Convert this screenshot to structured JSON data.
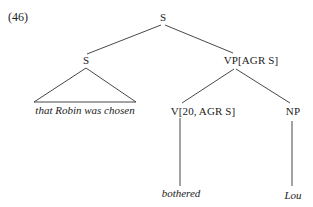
{
  "example": {
    "number": "(46)"
  },
  "tree": {
    "root": {
      "label": "S"
    },
    "left_s": {
      "label": "S",
      "yield": "that Robin was chosen",
      "rendering": "triangle"
    },
    "vp": {
      "label": "VP[AGR S]"
    },
    "v": {
      "label": "V[20, AGR S]",
      "leaf": "bothered"
    },
    "np": {
      "label": "NP",
      "leaf": "Lou"
    },
    "structure": "[S [S that Robin was chosen] [VP[AGR S] [V[20, AGR S] bothered] [NP Lou]]]"
  }
}
